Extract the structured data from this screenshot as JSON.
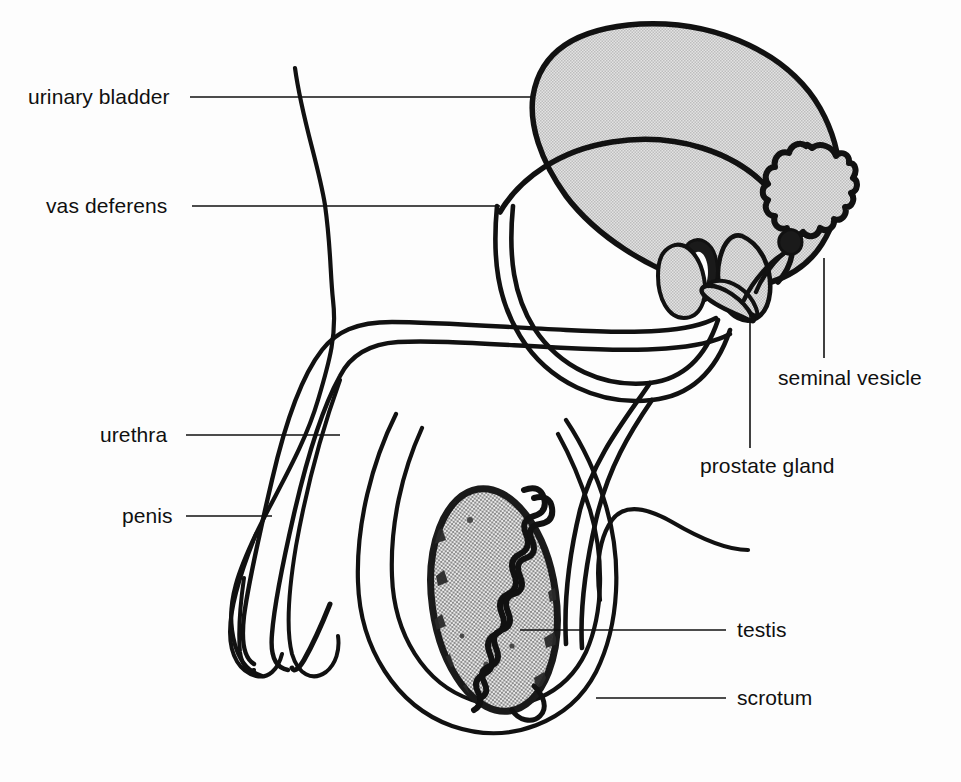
{
  "figure": {
    "background_color": "#fdfdfd",
    "ink_color": "#111111",
    "fill_grey": "#d0d0d0",
    "stipple_grey": "#b9b9b9"
  },
  "labels": [
    {
      "id": "urinary-bladder",
      "text": "urinary bladder",
      "x": 28,
      "y": 86,
      "leader": {
        "type": "horizontal",
        "x1": 190,
        "y1": 97,
        "x2": 532,
        "y2": 97
      }
    },
    {
      "id": "vas-deferens",
      "text": "vas deferens",
      "x": 46,
      "y": 195,
      "leader": {
        "type": "horizontal",
        "x1": 192,
        "y1": 206,
        "x2": 500,
        "y2": 206
      }
    },
    {
      "id": "urethra",
      "text": "urethra",
      "x": 100,
      "y": 424,
      "leader": {
        "type": "horizontal",
        "x1": 186,
        "y1": 435,
        "x2": 340,
        "y2": 435
      }
    },
    {
      "id": "penis",
      "text": "penis",
      "x": 122,
      "y": 505,
      "leader": {
        "type": "horizontal",
        "x1": 186,
        "y1": 516,
        "x2": 272,
        "y2": 516
      }
    },
    {
      "id": "seminal-vesicle",
      "text": "seminal vesicle",
      "x": 778,
      "y": 367,
      "leader": {
        "type": "vertical",
        "x1": 824,
        "y1": 258,
        "x2": 824,
        "y2": 358
      }
    },
    {
      "id": "prostate-gland",
      "text": "prostate gland",
      "x": 700,
      "y": 455,
      "leader": {
        "type": "vertical",
        "x1": 750,
        "y1": 312,
        "x2": 750,
        "y2": 448
      }
    },
    {
      "id": "testis",
      "text": "testis",
      "x": 737,
      "y": 619,
      "leader": {
        "type": "horizontal",
        "x1": 520,
        "y1": 630,
        "x2": 726,
        "y2": 630
      }
    },
    {
      "id": "scrotum",
      "text": "scrotum",
      "x": 737,
      "y": 687,
      "leader": {
        "type": "horizontal",
        "x1": 596,
        "y1": 698,
        "x2": 726,
        "y2": 698
      }
    }
  ],
  "structures": [
    {
      "id": "urinary-bladder",
      "name": "urinary bladder",
      "fill": "grey",
      "outline": "thick"
    },
    {
      "id": "vas-deferens",
      "name": "vas deferens",
      "fill": "none",
      "outline": "tube"
    },
    {
      "id": "urethra",
      "name": "urethra",
      "fill": "none",
      "outline": "tube"
    },
    {
      "id": "penis",
      "name": "penis",
      "fill": "none",
      "outline": "thin"
    },
    {
      "id": "seminal-vesicle",
      "name": "seminal vesicle",
      "fill": "grey",
      "outline": "lobulated"
    },
    {
      "id": "prostate-gland",
      "name": "prostate gland",
      "fill": "grey",
      "outline": "thick"
    },
    {
      "id": "testis",
      "name": "testis",
      "fill": "stipple",
      "outline": "speckled"
    },
    {
      "id": "epididymis",
      "name": "epididymis",
      "fill": "none",
      "outline": "coiled"
    },
    {
      "id": "scrotum",
      "name": "scrotum",
      "fill": "none",
      "outline": "thin"
    },
    {
      "id": "body-wall",
      "name": "abdominal body wall",
      "fill": "none",
      "outline": "thin"
    },
    {
      "id": "thigh",
      "name": "thigh contour",
      "fill": "none",
      "outline": "thin"
    }
  ]
}
